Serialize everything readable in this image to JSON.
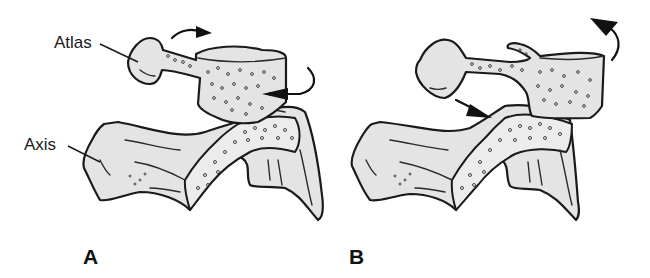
{
  "figure": {
    "panels": [
      {
        "id": "A",
        "letter": "A"
      },
      {
        "id": "B",
        "letter": "B"
      }
    ],
    "labels": {
      "atlas": "Atlas",
      "axis": "Axis"
    },
    "colors": {
      "bone_fill": "#e4e4e4",
      "outline": "#1a1a1a",
      "background": "#ffffff"
    },
    "arrows": {
      "A": [
        "rotation-arrow-top-right",
        "rotation-arrow-curved-left"
      ],
      "B": [
        "pressure-arrow-down-right",
        "rotation-arrow-up-left"
      ]
    }
  }
}
